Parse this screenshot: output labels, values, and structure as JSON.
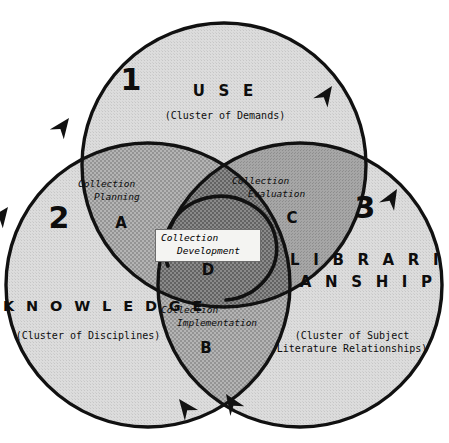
{
  "figure": {
    "kind": "three-circle-venn"
  },
  "circles": [
    {
      "id": "use",
      "number": "1",
      "name": "U S E",
      "subtitle": "(Cluster of Demands)",
      "fill_color": "#d9d9d9"
    },
    {
      "id": "knowledge",
      "number": "2",
      "name": "K N O W L E D G E",
      "subtitle": "(Cluster of Disciplines)",
      "fill_color": "#d9d9d9"
    },
    {
      "id": "librarianship",
      "number": "3",
      "name_line1": "L I B R A R I -",
      "name_line2": "A N S H I P",
      "subtitle_line1": "(Cluster of Subject",
      "subtitle_line2": "Literature Relationships)",
      "fill_color": "#d9d9d9"
    }
  ],
  "zones": [
    {
      "letter": "A",
      "name_line1": "Collection",
      "name_line2": "Planning",
      "fill_color": "#a8a8a8"
    },
    {
      "letter": "B",
      "name_line1": "Collection",
      "name_line2": "Implementation",
      "fill_color": "#a8a8a8"
    },
    {
      "letter": "C",
      "name_line1": "Collection",
      "name_line2": "Evaluation",
      "fill_color": "#9e9e9e"
    },
    {
      "letter": "D",
      "name_line1": "Collection",
      "name_line2": "Development",
      "fill_color": "#7a7a7a"
    }
  ],
  "center_label": {
    "line1": "Collection",
    "line2": "Development"
  },
  "colors": {
    "outline": "#111111",
    "arrow": "#111111",
    "background": "#ffffff",
    "circle_fill": "#d9d9d9",
    "pair_overlap": "#a8a8a8",
    "triple_overlap": "#7a7a7a"
  },
  "arrows": {
    "count": 6,
    "direction": "clockwise",
    "glyph": "arrowhead"
  }
}
